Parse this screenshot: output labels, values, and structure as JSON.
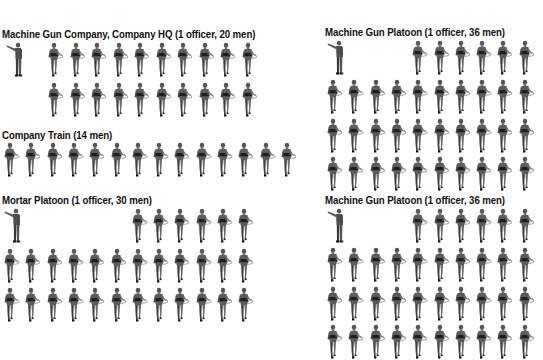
{
  "units": [
    {
      "id": "mg-company-hq",
      "title": "Machine Gun Company, Company HQ (1 officer, 20 men)",
      "officers": 1,
      "men": 20,
      "x": 2,
      "y": 28,
      "rows": [
        {
          "y": 14,
          "start_col": 0,
          "count": 10,
          "x0": 44
        },
        {
          "y": 54,
          "start_col": 0,
          "count": 10,
          "x0": 44
        }
      ],
      "officer_pos": {
        "x": 4,
        "y": 14
      },
      "col_step": 21.5
    },
    {
      "id": "company-train",
      "title": "Company Train (14 men)",
      "officers": 0,
      "men": 14,
      "x": 2,
      "y": 129,
      "rows": [
        {
          "y": 13,
          "start_col": 0,
          "count": 14,
          "x0": 0
        }
      ],
      "col_step": 21.3
    },
    {
      "id": "mortar-platoon",
      "title": "Mortar Platoon (1 officer, 30 men)",
      "officers": 1,
      "men": 30,
      "x": 2,
      "y": 194,
      "rows": [
        {
          "y": 14,
          "start_col": 6,
          "count": 6,
          "x0": 0
        },
        {
          "y": 54,
          "start_col": 0,
          "count": 12,
          "x0": 0
        },
        {
          "y": 93,
          "start_col": 0,
          "count": 12,
          "x0": 0
        }
      ],
      "officer_pos": {
        "x": 2,
        "y": 14
      },
      "col_step": 21.3
    },
    {
      "id": "mg-platoon-1",
      "title": "Machine Gun Platoon (1 officer, 36 men)",
      "officers": 1,
      "men": 36,
      "x": 325,
      "y": 26,
      "rows": [
        {
          "y": 14,
          "start_col": 4,
          "count": 6,
          "x0": 0
        },
        {
          "y": 53,
          "start_col": 0,
          "count": 10,
          "x0": 0
        },
        {
          "y": 92,
          "start_col": 0,
          "count": 10,
          "x0": 0
        },
        {
          "y": 130,
          "start_col": 0,
          "count": 10,
          "x0": 0
        }
      ],
      "officer_pos": {
        "x": 2,
        "y": 14
      },
      "col_step": 21.3
    },
    {
      "id": "mg-platoon-2",
      "title": "Machine Gun Platoon (1 officer, 36 men)",
      "officers": 1,
      "men": 36,
      "x": 325,
      "y": 194,
      "rows": [
        {
          "y": 14,
          "start_col": 4,
          "count": 6,
          "x0": 0
        },
        {
          "y": 53,
          "start_col": 0,
          "count": 10,
          "x0": 0
        },
        {
          "y": 92,
          "start_col": 0,
          "count": 10,
          "x0": 0
        },
        {
          "y": 130,
          "start_col": 0,
          "count": 10,
          "x0": 0
        }
      ],
      "officer_pos": {
        "x": 2,
        "y": 14
      },
      "col_step": 21.3
    }
  ],
  "icons": {
    "soldier": "marching-soldier-icon",
    "officer": "pointing-officer-icon"
  },
  "colors": {
    "figure_dark": "#2a2a2a",
    "figure_mid": "#6a6a6a",
    "figure_light": "#a8a8a8",
    "text": "#111111",
    "background": "#ffffff"
  }
}
